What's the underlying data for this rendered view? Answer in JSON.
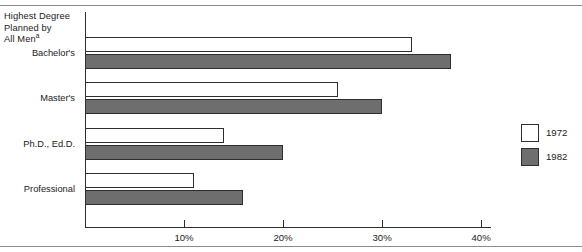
{
  "chart_data": {
    "type": "bar",
    "orientation": "horizontal",
    "title": "",
    "xlabel": "",
    "ylabel": "Highest Degree Planned by All Men",
    "axis_note": "a",
    "categories": [
      "Bachelor's",
      "Master's",
      "Ph.D., Ed.D.",
      "Professional"
    ],
    "series": [
      {
        "name": "1972",
        "color": "#ffffff",
        "values": [
          33,
          25.5,
          14,
          11
        ]
      },
      {
        "name": "1982",
        "color": "#6e6e6e",
        "values": [
          37,
          30,
          20,
          16
        ]
      }
    ],
    "xlim": [
      0,
      41
    ],
    "xticks": [
      10,
      20,
      30,
      40
    ],
    "xtick_labels": [
      "10%",
      "20%",
      "30%",
      "40%"
    ],
    "grid": false,
    "legend_position": "right"
  },
  "axis": {
    "category_header_line1": "Highest Degree",
    "category_header_line2": "Planned by",
    "category_header_line3": "All Men",
    "category_header_superscript": "a"
  },
  "legend": {
    "entries": [
      {
        "label": "1972",
        "swatch": "white-square-swatch"
      },
      {
        "label": "1982",
        "swatch": "gray-square-swatch"
      }
    ]
  }
}
